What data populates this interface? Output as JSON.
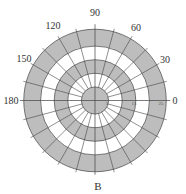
{
  "diagram": {
    "type": "polar-grid",
    "center": {
      "x": 95,
      "y": 100.5
    },
    "scale_px_per_unit": 2.72,
    "colors": {
      "band_fill": "#bdbdbd",
      "background": "#ffffff",
      "line": "#444444",
      "text": "#333333"
    },
    "bands": [
      {
        "r_inner": 20,
        "r_outer": 26.2,
        "fill": "gray"
      },
      {
        "r_inner": 15,
        "r_outer": 20,
        "fill": "white"
      },
      {
        "r_inner": 10,
        "r_outer": 15,
        "fill": "gray"
      },
      {
        "r_inner": 5,
        "r_outer": 10,
        "fill": "white"
      },
      {
        "r_inner": 0,
        "r_outer": 5,
        "fill": "gray"
      }
    ],
    "spoke_step_deg": 15,
    "angle_labels": [
      {
        "angle": 0,
        "text": "0"
      },
      {
        "angle": 30,
        "text": "30"
      },
      {
        "angle": 60,
        "text": "60"
      },
      {
        "angle": 90,
        "text": "90"
      },
      {
        "angle": 120,
        "text": "120"
      },
      {
        "angle": 150,
        "text": "150"
      },
      {
        "angle": 180,
        "text": "180"
      }
    ],
    "radial_labels": [
      {
        "r": 5,
        "text": "5"
      },
      {
        "r": 15,
        "text": "15"
      },
      {
        "r": 25,
        "text": "25"
      }
    ],
    "bottom_label": "B"
  }
}
